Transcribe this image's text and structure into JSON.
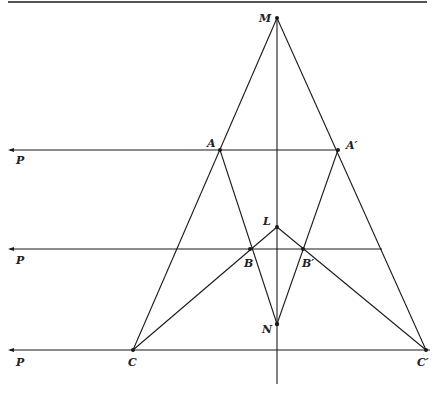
{
  "figure": {
    "labels": {
      "M": "M",
      "A": "A",
      "A_prime": "A′",
      "L": "L",
      "B": "B",
      "B_prime": "B′",
      "N": "N",
      "C": "C",
      "C_prime": "C′",
      "P1": "P",
      "P2": "P",
      "P3": "P"
    },
    "points": {
      "M": [
        277,
        18
      ],
      "A": [
        220,
        150
      ],
      "A_prime": [
        338,
        150
      ],
      "L": [
        277,
        227
      ],
      "B": [
        250,
        249
      ],
      "B_prime": [
        303,
        249
      ],
      "N": [
        277,
        324
      ],
      "C": [
        133,
        350
      ],
      "C_prime": [
        426,
        350
      ]
    },
    "line_color": "#1a1a1a"
  }
}
